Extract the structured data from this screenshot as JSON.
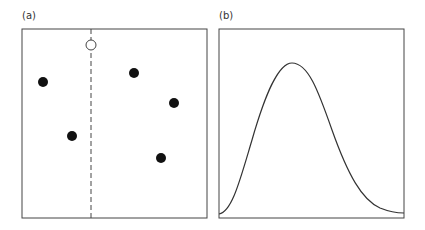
{
  "panels": [
    {
      "label": "(a)",
      "points_filled": [
        [
          43,
          82
        ],
        [
          134,
          73
        ],
        [
          174,
          103
        ],
        [
          72,
          136
        ],
        [
          161,
          158
        ]
      ],
      "point_open": [
        91,
        45
      ],
      "dashed_x": 91
    },
    {
      "label": "(b)",
      "curve": "unimodal right-skewed bell curve"
    }
  ],
  "colors": {
    "stroke": "#444444",
    "dot": "#111111"
  }
}
